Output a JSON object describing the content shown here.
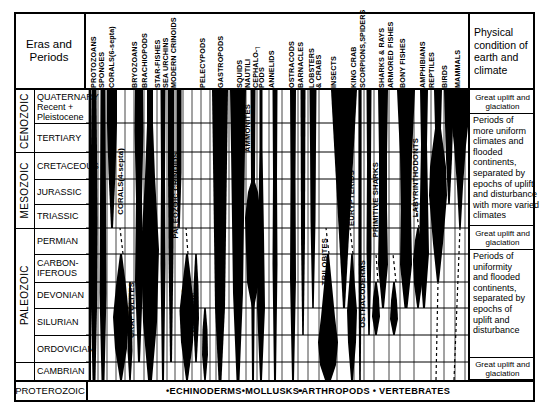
{
  "header": {
    "eras_title": "Eras and\nPeriods",
    "physical_title": "Physical\ncondition\nof earth\nand climate"
  },
  "columns": [
    {
      "label": "PROTOZOANS",
      "x": 4,
      "w": 7
    },
    {
      "label": "SPONGES",
      "x": 12,
      "w": 7
    },
    {
      "label": "CORALS(6-septa)",
      "x": 21,
      "w": 8
    },
    {
      "label": "CORALS(4-septa)",
      "x": 31,
      "w": 8
    },
    {
      "label": "BRYOZOANS",
      "x": 45,
      "w": 8
    },
    {
      "label": "BRACHIOPODS",
      "x": 55,
      "w": 9
    },
    {
      "label": "STAR-FISHES",
      "x": 68,
      "w": 7
    },
    {
      "label": "SEA URCHINS",
      "x": 76,
      "w": 7
    },
    {
      "label": "MODERN CRINOIDS",
      "x": 84,
      "w": 7
    },
    {
      "label": "PELECYPODS",
      "x": 113,
      "w": 12
    },
    {
      "label": "GASTROPODS",
      "x": 131,
      "w": 12
    },
    {
      "label": "SQUIDS",
      "x": 150,
      "w": 7
    },
    {
      "label": "NAUTILI",
      "x": 158,
      "w": 7
    },
    {
      "label": "ANNELIDS",
      "x": 172,
      "w": 9
    },
    {
      "label": "OSTRACODS",
      "x": 192,
      "w": 8
    },
    {
      "label": "BARNACLES",
      "x": 202,
      "w": 8
    },
    {
      "label": "LOBSTERS & CRABS",
      "x": 212,
      "w": 8
    },
    {
      "label": "INSECTS",
      "x": 228,
      "w": 14
    },
    {
      "label": "KING CRAB",
      "x": 250,
      "w": 7
    },
    {
      "label": "SCORPIONS",
      "x": 259,
      "w": 7
    },
    {
      "label": "SPIDERS",
      "x": 267,
      "w": 7
    },
    {
      "label": "SHARKS & RAYS",
      "x": 281,
      "w": 9
    },
    {
      "label": "ARMORED FISHES",
      "x": 292,
      "w": 9
    },
    {
      "label": "BONY FISHES",
      "x": 305,
      "w": 11
    },
    {
      "label": "AMPHIBIANS",
      "x": 324,
      "w": 9
    },
    {
      "label": "REPTILES",
      "x": 335,
      "w": 9
    },
    {
      "label": "BIRDS",
      "x": 349,
      "w": 9
    },
    {
      "label": "MAMMALS",
      "x": 361,
      "w": 14
    }
  ],
  "header_label_groups": [
    {
      "label": "PROTOZOANS",
      "x": 90
    },
    {
      "label": "SPONGES",
      "x": 98
    },
    {
      "label": "CORALS(6-septa)",
      "x": 108
    },
    {
      "label": "BRYOZOANS",
      "x": 131
    },
    {
      "label": "BRACHIOPODS",
      "x": 141
    },
    {
      "label": "STAR-FISHES",
      "x": 154
    },
    {
      "label": "SEA URCHINS",
      "x": 162
    },
    {
      "label": "MODERN CRINOIDS",
      "x": 170
    },
    {
      "label": "PELECYPODS",
      "x": 199
    },
    {
      "label": "GASTROPODS",
      "x": 217
    },
    {
      "label": "SQUIDS",
      "x": 236
    },
    {
      "label": "NAUTILI",
      "x": 244
    },
    {
      "label": "CEPHALO-┐",
      "x": 252
    },
    {
      "label": "PODS",
      "x": 258
    },
    {
      "label": "ANNELIDS",
      "x": 268
    },
    {
      "label": "OSTRACODS",
      "x": 288
    },
    {
      "label": "BARNACLES",
      "x": 297
    },
    {
      "label": "LOBSTERS",
      "x": 308
    },
    {
      "label": "& CRABS",
      "x": 315
    },
    {
      "label": "INSECTS",
      "x": 330
    },
    {
      "label": "KING CRAB",
      "x": 350
    },
    {
      "label": "SCORPIONS,SPIDERS",
      "x": 359
    },
    {
      "label": "SHARKS & RAYS",
      "x": 378
    },
    {
      "label": "ARMORED FISHES",
      "x": 387
    },
    {
      "label": "BONY FISHES",
      "x": 399
    },
    {
      "label": "AMPHIBIANS",
      "x": 419
    },
    {
      "label": "REPTILES",
      "x": 428
    },
    {
      "label": "BIRDS",
      "x": 441
    },
    {
      "label": "MAMMALS",
      "x": 454
    }
  ],
  "eras": [
    {
      "label": "CENOZOIC",
      "y": 90,
      "h": 62
    },
    {
      "label": "MESOZOIC",
      "y": 152,
      "h": 76
    },
    {
      "label": "PALEOZOIC",
      "y": 228,
      "h": 134
    },
    {
      "label": "",
      "y": 362,
      "h": 18
    }
  ],
  "periods": [
    {
      "label": "QUATERNARY\nRecent +\nPleistocene",
      "y": 90,
      "h": 33
    },
    {
      "label": "TERTIARY",
      "y": 123,
      "h": 29
    },
    {
      "label": "CRETACEOUS",
      "y": 152,
      "h": 27
    },
    {
      "label": "JURASSIC",
      "y": 179,
      "h": 25
    },
    {
      "label": "TRIASSIC",
      "y": 204,
      "h": 24
    },
    {
      "label": "PERMIAN",
      "y": 228,
      "h": 26
    },
    {
      "label": "CARBON-\nIFEROUS",
      "y": 254,
      "h": 28
    },
    {
      "label": "DEVONIAN",
      "y": 282,
      "h": 26
    },
    {
      "label": "SILURIAN",
      "y": 308,
      "h": 27
    },
    {
      "label": "ORDOVICIAN",
      "y": 335,
      "h": 27
    },
    {
      "label": "CAMBRIAN",
      "y": 362,
      "h": 18
    }
  ],
  "proterozoic": {
    "label": "PROTEROZOIC",
    "y": 380,
    "h": 22
  },
  "physical_conditions": [
    {
      "text": "Great uplift and\nglaciation",
      "y": 90,
      "h": 24,
      "center": true
    },
    {
      "text": "Periods of\nmore uniform\nclimates and\nflooded\ncontinents,\nseparated by\nepochs of uplift\nand disturbance\nwith more varied\nclimates",
      "y": 114,
      "h": 112,
      "center": false
    },
    {
      "text": "Great uplift and\nglaciation",
      "y": 226,
      "h": 24,
      "center": true
    },
    {
      "text": "Periods of\nuniformity\nand flooded\ncontinents,\nseparated by\nepochs of\nuplift and\ndisturbance",
      "y": 250,
      "h": 108,
      "center": false
    },
    {
      "text": "Great uplift and\nglaciation",
      "y": 358,
      "h": 22,
      "center": true
    }
  ],
  "footer_groups": [
    {
      "label": "•ECHINODERMS•MOLLUSKS•",
      "x": 166
    },
    {
      "label": "•ARTHROPODS • VERTEBRATES",
      "x": 298
    }
  ],
  "inchart_labels": [
    {
      "label": "CORALS(4-septa)",
      "x": 30,
      "y": 58,
      "white": false
    },
    {
      "label": "GRAPTOLITES",
      "x": 41,
      "y": 192,
      "white": false
    },
    {
      "label": "PALEOZOIC CRINOIDS",
      "x": 85,
      "y": 62,
      "white": false
    },
    {
      "label": "BLASTOIDS",
      "x": 94,
      "y": 198,
      "white": false
    },
    {
      "label": "CYSTOIDS",
      "x": 104,
      "y": 202,
      "white": false
    },
    {
      "label": "AMMONITES",
      "x": 157,
      "y": 14,
      "white": false
    },
    {
      "label": "TRILOBITES",
      "x": 234,
      "y": 148,
      "white": false
    },
    {
      "label": "EURYPTERIDS",
      "x": 261,
      "y": 80,
      "white": false
    },
    {
      "label": "OSTRACODERMS",
      "x": 272,
      "y": 170,
      "white": false
    },
    {
      "label": "PRIMITIVE SHARKS",
      "x": 285,
      "y": 72,
      "white": false
    },
    {
      "label": "LABYRINTHODONTS",
      "x": 325,
      "y": 48,
      "white": false
    }
  ],
  "chart_data": {
    "type": "area",
    "xlabel": "Fossil groups",
    "ylabel": "Geologic time (Eras and Periods)",
    "grid": true,
    "legend": "none",
    "note": "Horizontal width of each black spindle indicates relative abundance of that group through geologic time; dashed lines indicate inferred or uncertain ranges.",
    "time_axis": [
      "QUATERNARY Recent + Pleistocene",
      "TERTIARY",
      "CRETACEOUS",
      "JURASSIC",
      "TRIASSIC",
      "PERMIAN",
      "CARBONIFEROUS",
      "DEVONIAN",
      "SILURIAN",
      "ORDOVICIAN",
      "CAMBRIAN",
      "PROTEROZOIC"
    ],
    "series": [
      {
        "name": "PROTOZOANS",
        "range": [
          "CAMBRIAN",
          "QUATERNARY"
        ]
      },
      {
        "name": "SPONGES",
        "range": [
          "CAMBRIAN",
          "QUATERNARY"
        ]
      },
      {
        "name": "CORALS(6-septa)",
        "range": [
          "TRIASSIC",
          "QUATERNARY"
        ]
      },
      {
        "name": "CORALS(4-septa)",
        "range": [
          "ORDOVICIAN",
          "PERMIAN"
        ]
      },
      {
        "name": "GRAPTOLITES",
        "range": [
          "CAMBRIAN",
          "CARBONIFEROUS"
        ]
      },
      {
        "name": "BRYOZOANS",
        "range": [
          "ORDOVICIAN",
          "QUATERNARY"
        ]
      },
      {
        "name": "BRACHIOPODS",
        "range": [
          "CAMBRIAN",
          "QUATERNARY"
        ]
      },
      {
        "name": "STAR-FISHES",
        "range": [
          "ORDOVICIAN",
          "QUATERNARY"
        ]
      },
      {
        "name": "SEA URCHINS",
        "range": [
          "ORDOVICIAN",
          "QUATERNARY"
        ]
      },
      {
        "name": "MODERN CRINOIDS",
        "range": [
          "TRIASSIC",
          "QUATERNARY"
        ]
      },
      {
        "name": "PALEOZOIC CRINOIDS",
        "range": [
          "ORDOVICIAN",
          "PERMIAN"
        ]
      },
      {
        "name": "BLASTOIDS",
        "range": [
          "ORDOVICIAN",
          "PERMIAN"
        ]
      },
      {
        "name": "CYSTOIDS",
        "range": [
          "CAMBRIAN",
          "DEVONIAN"
        ]
      },
      {
        "name": "PELECYPODS",
        "range": [
          "CAMBRIAN",
          "QUATERNARY"
        ]
      },
      {
        "name": "GASTROPODS",
        "range": [
          "CAMBRIAN",
          "QUATERNARY"
        ]
      },
      {
        "name": "SQUIDS",
        "range": [
          "CAMBRIAN",
          "QUATERNARY"
        ]
      },
      {
        "name": "NAUTILI",
        "range": [
          "CAMBRIAN",
          "QUATERNARY"
        ]
      },
      {
        "name": "AMMONITES",
        "range": [
          "DEVONIAN",
          "CRETACEOUS"
        ]
      },
      {
        "name": "ANNELIDS",
        "range": [
          "CAMBRIAN",
          "QUATERNARY"
        ]
      },
      {
        "name": "OSTRACODS",
        "range": [
          "CAMBRIAN",
          "QUATERNARY"
        ]
      },
      {
        "name": "BARNACLES",
        "range": [
          "SILURIAN",
          "QUATERNARY"
        ]
      },
      {
        "name": "LOBSTERS & CRABS",
        "range": [
          "DEVONIAN",
          "QUATERNARY"
        ]
      },
      {
        "name": "TRILOBITES",
        "range": [
          "CAMBRIAN",
          "PERMIAN"
        ]
      },
      {
        "name": "INSECTS",
        "range": [
          "DEVONIAN",
          "QUATERNARY"
        ]
      },
      {
        "name": "KING CRAB",
        "range": [
          "CAMBRIAN",
          "QUATERNARY"
        ]
      },
      {
        "name": "SCORPIONS,SPIDERS",
        "range": [
          "SILURIAN",
          "QUATERNARY"
        ]
      },
      {
        "name": "EURYPTERIDS",
        "range": [
          "CAMBRIAN",
          "PERMIAN"
        ]
      },
      {
        "name": "OSTRACODERMS",
        "range": [
          "ORDOVICIAN",
          "DEVONIAN"
        ]
      },
      {
        "name": "SHARKS & RAYS",
        "range": [
          "DEVONIAN",
          "QUATERNARY"
        ]
      },
      {
        "name": "PRIMITIVE SHARKS",
        "range": [
          "SILURIAN",
          "PERMIAN"
        ]
      },
      {
        "name": "ARMORED FISHES",
        "range": [
          "SILURIAN",
          "CARBONIFEROUS"
        ]
      },
      {
        "name": "BONY FISHES",
        "range": [
          "DEVONIAN",
          "QUATERNARY"
        ]
      },
      {
        "name": "AMPHIBIANS",
        "range": [
          "DEVONIAN",
          "QUATERNARY"
        ]
      },
      {
        "name": "LABYRINTHODONTS",
        "range": [
          "DEVONIAN",
          "TRIASSIC"
        ]
      },
      {
        "name": "REPTILES",
        "range": [
          "CARBONIFEROUS",
          "QUATERNARY"
        ]
      },
      {
        "name": "BIRDS",
        "range": [
          "JURASSIC",
          "QUATERNARY"
        ]
      },
      {
        "name": "MAMMALS",
        "range": [
          "TRIASSIC",
          "QUATERNARY"
        ]
      }
    ]
  }
}
